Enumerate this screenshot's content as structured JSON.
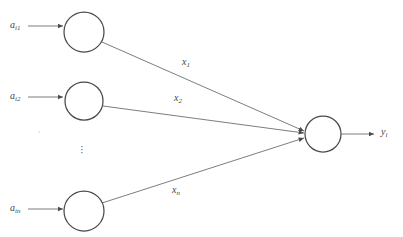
{
  "figure": {
    "type": "artificial-neuron-diagram",
    "background_color": "#ffffff",
    "line_color": "#6e6e6e",
    "node_stroke_color": "#4a4a4a",
    "text_color": "#444444"
  },
  "inputs": [
    {
      "label_base": "a",
      "label_sub": "i1",
      "arrow": "right-arrow-icon"
    },
    {
      "label_base": "a",
      "label_sub": "i2",
      "arrow": "right-arrow-icon"
    },
    {
      "label_base": "a",
      "label_sub": "in",
      "arrow": "right-arrow-icon"
    }
  ],
  "weights": [
    {
      "label_base": "x",
      "label_sub": "1"
    },
    {
      "label_base": "x",
      "label_sub": "2"
    },
    {
      "label_base": "x",
      "label_sub": "n"
    }
  ],
  "output": {
    "label_base": "y",
    "label_sub": "i",
    "arrow": "right-arrow-icon"
  },
  "ellipsis": {
    "glyph": "·",
    "count": 3,
    "orientation": "vertical"
  },
  "nodes": {
    "input_node_1": {
      "cx": 84,
      "cy": 32,
      "r": 20
    },
    "input_node_2": {
      "cx": 84,
      "cy": 101,
      "r": 19
    },
    "input_node_3": {
      "cx": 84,
      "cy": 211,
      "r": 20
    },
    "output_node": {
      "cx": 323,
      "cy": 134,
      "r": 18
    }
  }
}
